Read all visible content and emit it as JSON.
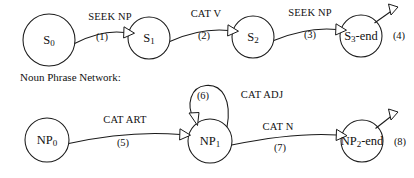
{
  "figure": {
    "background_color": "#ffffff",
    "ink_color": "#1a1a1a",
    "section_caption": "Noun Phrase Network:"
  },
  "sentence_network": {
    "nodes": [
      {
        "id": "s0",
        "base": "S",
        "subscript": "0",
        "suffix": "",
        "cx": 49,
        "cy": 40,
        "r": 26
      },
      {
        "id": "s1",
        "base": "S",
        "subscript": "1",
        "suffix": "",
        "cx": 149,
        "cy": 38,
        "r": 21
      },
      {
        "id": "s2",
        "base": "S",
        "subscript": "2",
        "suffix": "",
        "cx": 253,
        "cy": 37,
        "r": 21
      },
      {
        "id": "s3",
        "base": "S",
        "subscript": "3",
        "suffix": "-end",
        "cx": 361,
        "cy": 36,
        "r": 21
      }
    ],
    "edges": [
      {
        "id": "e1",
        "label": "SEEK NP",
        "number": "(1)",
        "from": "s0",
        "to": "s1"
      },
      {
        "id": "e2",
        "label": "CAT V",
        "number": "(2)",
        "from": "s1",
        "to": "s2"
      },
      {
        "id": "e3",
        "label": "SEEK NP",
        "number": "(3)",
        "from": "s2",
        "to": "s3"
      },
      {
        "id": "e4",
        "label": "",
        "number": "(4)",
        "from": "s3",
        "to": "exit"
      }
    ]
  },
  "noun_phrase_network": {
    "nodes": [
      {
        "id": "np0",
        "base": "NP",
        "subscript": "0",
        "suffix": "",
        "cx": 47,
        "cy": 140,
        "r": 22
      },
      {
        "id": "np1",
        "base": "NP",
        "subscript": "1",
        "suffix": "",
        "cx": 210,
        "cy": 141,
        "r": 22
      },
      {
        "id": "np2",
        "base": "NP",
        "subscript": "2",
        "suffix": "-end",
        "cx": 362,
        "cy": 141,
        "r": 21
      }
    ],
    "edges": [
      {
        "id": "e5",
        "label": "CAT ART",
        "number": "(5)",
        "from": "np0",
        "to": "np1"
      },
      {
        "id": "e6",
        "label": "CAT ADJ",
        "number": "(6)",
        "from": "np1",
        "to": "np1"
      },
      {
        "id": "e7",
        "label": "CAT N",
        "number": "(7)",
        "from": "np1",
        "to": "np2"
      },
      {
        "id": "e8",
        "label": "",
        "number": "(8)",
        "from": "np2",
        "to": "exit"
      }
    ]
  },
  "labels": {
    "seek_np_1": "SEEK NP",
    "num_1": "(1)",
    "cat_v": "CAT V",
    "num_2": "(2)",
    "seek_np_3": "SEEK NP",
    "num_3": "(3)",
    "num_4": "(4)",
    "cat_art": "CAT ART",
    "num_5": "(5)",
    "num_6": "(6)",
    "cat_adj": "CAT ADJ",
    "cat_n": "CAT N",
    "num_7": "(7)",
    "num_8": "(8)"
  },
  "node_text": {
    "s0_base": "S",
    "s0_sub": "0",
    "s0_suffix": "",
    "s1_base": "S",
    "s1_sub": "1",
    "s1_suffix": "",
    "s2_base": "S",
    "s2_sub": "2",
    "s2_suffix": "",
    "s3_base": "S",
    "s3_sub": "3",
    "s3_suffix": "-end",
    "np0_base": "NP",
    "np0_sub": "0",
    "np0_suffix": "",
    "np1_base": "NP",
    "np1_sub": "1",
    "np1_suffix": "",
    "np2_base": "NP",
    "np2_sub": "2",
    "np2_suffix": "-end"
  }
}
